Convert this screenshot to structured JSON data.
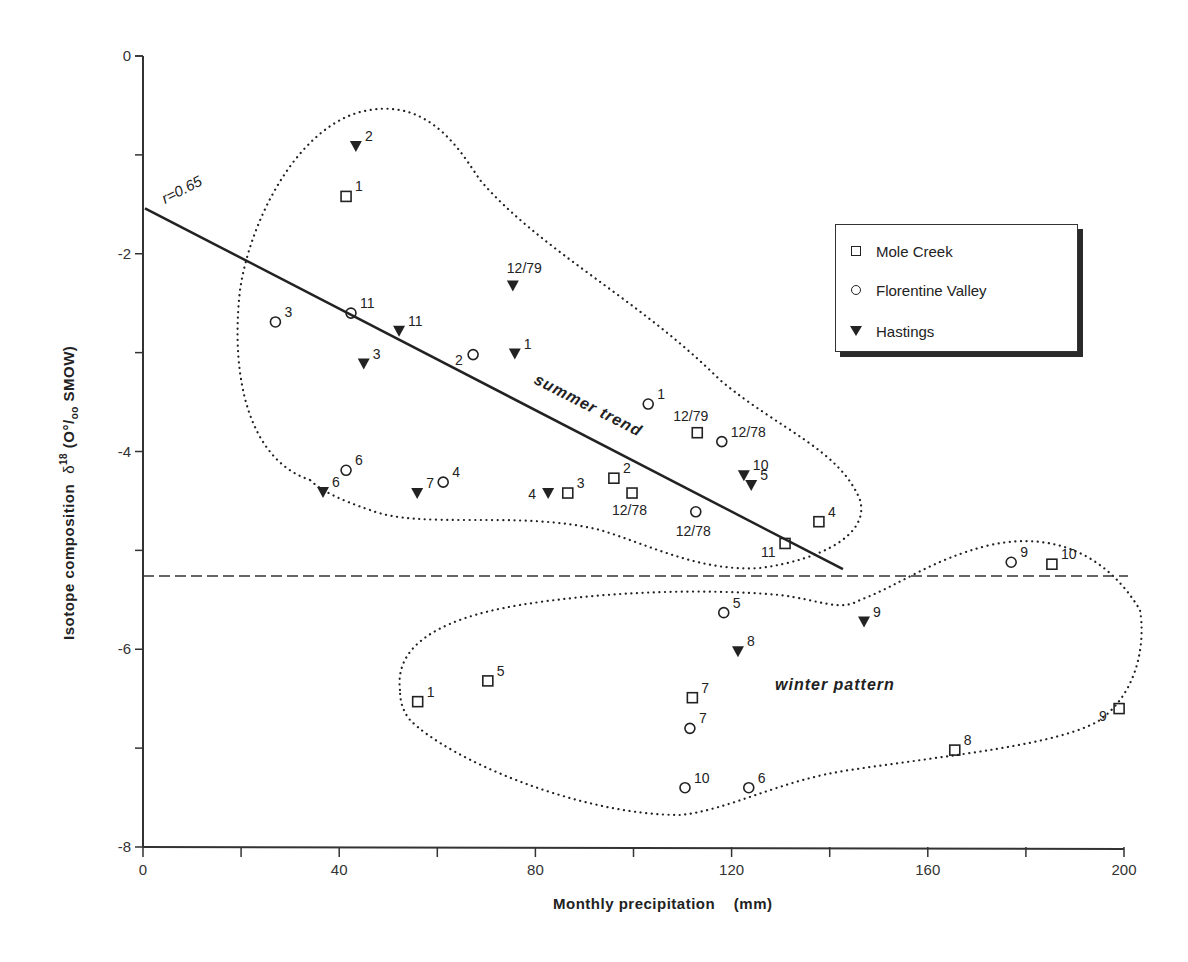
{
  "chart_data": {
    "type": "scatter",
    "title": "",
    "xlabel": "Monthly precipitation (mm)",
    "ylabel": "Isotope composition δ18 (O°/oo SMOW)",
    "xlim": [
      0,
      200
    ],
    "ylim": [
      -8,
      0
    ],
    "x_ticks": [
      0,
      40,
      80,
      120,
      160,
      200
    ],
    "x_minor_ticks": [
      20,
      60,
      100,
      140,
      180
    ],
    "y_ticks": [
      0,
      -2,
      -4,
      -6,
      -8
    ],
    "y_minor_ticks": [
      -1,
      -3,
      -5,
      -7
    ],
    "grid": false,
    "legend_position": "upper right",
    "series": [
      {
        "name": "Mole Creek",
        "marker": "square-open",
        "points": [
          {
            "x": 41.4,
            "y": -1.42,
            "label": "1"
          },
          {
            "x": 113.0,
            "y": -3.81,
            "label": "12/79"
          },
          {
            "x": 96.0,
            "y": -4.27,
            "label": "2"
          },
          {
            "x": 99.7,
            "y": -4.42,
            "label": "12/78"
          },
          {
            "x": 86.6,
            "y": -4.42,
            "label": "3"
          },
          {
            "x": 137.8,
            "y": -4.71,
            "label": "4"
          },
          {
            "x": 130.9,
            "y": -4.93,
            "label": "11"
          },
          {
            "x": 185.3,
            "y": -5.14,
            "label": "10"
          },
          {
            "x": 70.3,
            "y": -6.32,
            "label": "5"
          },
          {
            "x": 56.0,
            "y": -6.53,
            "label": "1"
          },
          {
            "x": 112.0,
            "y": -6.49,
            "label": "7"
          },
          {
            "x": 165.5,
            "y": -7.02,
            "label": "8"
          },
          {
            "x": 199.0,
            "y": -6.6,
            "label": "9"
          }
        ]
      },
      {
        "name": "Florentine Valley",
        "marker": "circle-open",
        "points": [
          {
            "x": 27.0,
            "y": -2.69,
            "label": "3"
          },
          {
            "x": 42.4,
            "y": -2.6,
            "label": "11"
          },
          {
            "x": 67.3,
            "y": -3.02,
            "label": "2"
          },
          {
            "x": 103.0,
            "y": -3.52,
            "label": "1"
          },
          {
            "x": 118.0,
            "y": -3.9,
            "label": "12/78"
          },
          {
            "x": 41.4,
            "y": -4.19,
            "label": "6"
          },
          {
            "x": 61.2,
            "y": -4.31,
            "label": "4"
          },
          {
            "x": 112.7,
            "y": -4.61,
            "label": "12/78"
          },
          {
            "x": 177.0,
            "y": -5.12,
            "label": "9"
          },
          {
            "x": 118.4,
            "y": -5.63,
            "label": "5"
          },
          {
            "x": 111.5,
            "y": -6.8,
            "label": "7"
          },
          {
            "x": 110.5,
            "y": -7.4,
            "label": "10"
          },
          {
            "x": 123.5,
            "y": -7.4,
            "label": "6"
          }
        ]
      },
      {
        "name": "Hastings",
        "marker": "triangle-down-filled",
        "points": [
          {
            "x": 43.4,
            "y": -0.91,
            "label": "2"
          },
          {
            "x": 75.4,
            "y": -2.32,
            "label": "12/79"
          },
          {
            "x": 52.2,
            "y": -2.78,
            "label": "11"
          },
          {
            "x": 75.8,
            "y": -3.01,
            "label": "1"
          },
          {
            "x": 45.0,
            "y": -3.11,
            "label": "3"
          },
          {
            "x": 36.7,
            "y": -4.41,
            "label": "6"
          },
          {
            "x": 55.9,
            "y": -4.42,
            "label": "7"
          },
          {
            "x": 82.6,
            "y": -4.42,
            "label": "4"
          },
          {
            "x": 122.5,
            "y": -4.24,
            "label": "10"
          },
          {
            "x": 124.0,
            "y": -4.34,
            "label": "5"
          },
          {
            "x": 147.0,
            "y": -5.72,
            "label": "9"
          },
          {
            "x": 121.3,
            "y": -6.02,
            "label": "8"
          }
        ]
      }
    ],
    "regression_line": {
      "x1": 0.4,
      "y1": -1.54,
      "x2": 142.7,
      "y2": -5.19,
      "label": "r=0.65"
    },
    "reference_line": {
      "y": -5.26,
      "style": "dashed"
    },
    "annotations": [
      {
        "text": "summer trend",
        "region": "upper dotted envelope"
      },
      {
        "text": "winter pattern",
        "region": "lower dotted envelope"
      }
    ]
  },
  "labels": {
    "xlabel": "Monthly precipitation    (mm)",
    "ylabel_main": "Isotope composition",
    "ylabel_delta": "δ",
    "ylabel_sup": "18",
    "ylabel_unit": " (O°/",
    "ylabel_sub": "oo",
    "ylabel_end": " SMOW)",
    "r_label": "r=0.65",
    "summer": "summer   trend",
    "winter": "winter   pattern"
  },
  "legend": {
    "items": [
      {
        "label": "Mole Creek",
        "marker": "square"
      },
      {
        "label": "Florentine Valley",
        "marker": "circle"
      },
      {
        "label": "Hastings",
        "marker": "triangle"
      }
    ]
  }
}
